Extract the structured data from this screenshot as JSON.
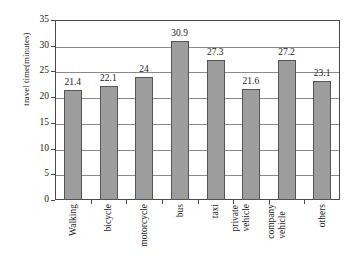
{
  "chart_data": {
    "type": "bar",
    "title": "",
    "xlabel": "",
    "ylabel": "travel time(minutes)",
    "ylim": [
      0,
      35
    ],
    "yticks": [
      0,
      5,
      10,
      15,
      20,
      25,
      30,
      35
    ],
    "grid": true,
    "legend": "none",
    "orientation": "vertical",
    "categories": [
      "Walking",
      "bicycle",
      "motorcycle",
      "bus",
      "private vehicle",
      "company vehicle",
      "others",
      "taxi"
    ],
    "category_display": [
      {
        "lines": [
          "Walking"
        ]
      },
      {
        "lines": [
          "bicycle"
        ]
      },
      {
        "lines": [
          "motorcycle"
        ]
      },
      {
        "lines": [
          "bus"
        ]
      },
      {
        "lines": [
          "taxi"
        ]
      },
      {
        "lines": [
          "private",
          "vehicle"
        ]
      },
      {
        "lines": [
          "company",
          "vehicle"
        ]
      },
      {
        "lines": [
          "others"
        ]
      }
    ],
    "ordered_categories": [
      "Walking",
      "bicycle",
      "motorcycle",
      "bus",
      "taxi",
      "private vehicle",
      "company vehicle",
      "others"
    ],
    "values": [
      21.4,
      22.1,
      24,
      30.9,
      27.3,
      21.6,
      27.2,
      23.1
    ],
    "value_labels": [
      "21.4",
      "22.1",
      "24",
      "30.9",
      "27.3",
      "21.6",
      "27.2",
      "23.1"
    ],
    "bar_color": "#9d9d9d",
    "bar_border_color": "#555555",
    "gridline_color": "#8a8a8a",
    "axis_color": "#4a4a4a"
  },
  "axis": {
    "y_tick_labels": [
      "35",
      "30",
      "25",
      "20",
      "15",
      "10",
      "5",
      "0"
    ]
  }
}
